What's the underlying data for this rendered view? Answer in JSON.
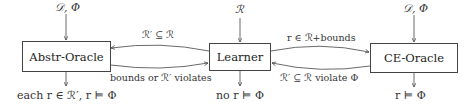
{
  "nodes": {
    "abstr_oracle": {
      "label": "Abstr-Oracle",
      "input": "𝒟, Φ",
      "output": "each r ∈ ℛ′, r ⊨ Φ"
    },
    "learner": {
      "label": "Learner",
      "input": "ℛ",
      "output": "no r ⊨ Φ"
    },
    "ce_oracle": {
      "label": "CE-Oracle",
      "input": "𝒟, Φ",
      "output": "r ⊨ Φ"
    }
  },
  "edges": {
    "learner_to_abstr": "ℛ′ ⊆ ℛ",
    "abstr_to_learner": "bounds or ℛ′ violates",
    "learner_to_ce": "r ∈ ℛ+bounds",
    "ce_to_learner": "ℛ′ ⊆ ℛ violate Φ"
  }
}
